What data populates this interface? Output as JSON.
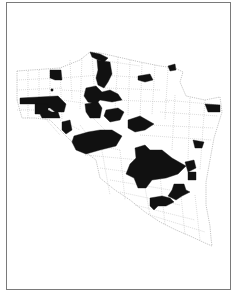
{
  "map": {
    "type": "choropleth",
    "description": "County-level map with selected counties shaded black",
    "colors": {
      "highlighted": "#111111",
      "unshaded": "#ffffff",
      "boundary": "#b0b0b0",
      "frame": "#7a7a7a"
    },
    "legend": null,
    "title": null
  }
}
